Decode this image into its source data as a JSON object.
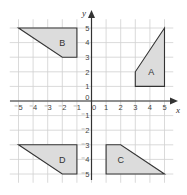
{
  "diagram": {
    "type": "coordinate-grid",
    "axes": {
      "x_label": "x",
      "y_label": "y",
      "x_range": [
        -5,
        5
      ],
      "y_range": [
        -5,
        5
      ],
      "x_ticks": [
        "⁻5",
        "⁻4",
        "⁻3",
        "⁻2",
        "⁻1",
        "0",
        "1",
        "2",
        "3",
        "4",
        "5"
      ],
      "y_ticks": [
        "5",
        "4",
        "3",
        "2",
        "1",
        "0",
        "⁻1",
        "⁻2",
        "⁻3",
        "⁻4",
        "⁻5"
      ]
    },
    "colors": {
      "grid": "#d0d0d0",
      "axis": "#333333",
      "shape_fill": "#dcdcdc",
      "shape_stroke": "#333333"
    },
    "shapes": [
      {
        "label": "A",
        "vertices": [
          [
            3,
            1
          ],
          [
            5,
            1
          ],
          [
            5,
            5
          ],
          [
            3,
            2
          ]
        ],
        "label_pos": [
          4.1,
          2
        ]
      },
      {
        "label": "B",
        "vertices": [
          [
            -5,
            5
          ],
          [
            -1,
            5
          ],
          [
            -1,
            3
          ],
          [
            -2,
            3
          ]
        ],
        "label_pos": [
          -2,
          4
        ]
      },
      {
        "label": "C",
        "vertices": [
          [
            1,
            -3
          ],
          [
            2,
            -3
          ],
          [
            5,
            -5
          ],
          [
            1,
            -5
          ]
        ],
        "label_pos": [
          2,
          -4
        ]
      },
      {
        "label": "D",
        "vertices": [
          [
            -5,
            -3
          ],
          [
            -1,
            -3
          ],
          [
            -1,
            -5
          ],
          [
            -2,
            -5
          ]
        ],
        "label_pos": [
          -2,
          -4
        ]
      }
    ]
  }
}
